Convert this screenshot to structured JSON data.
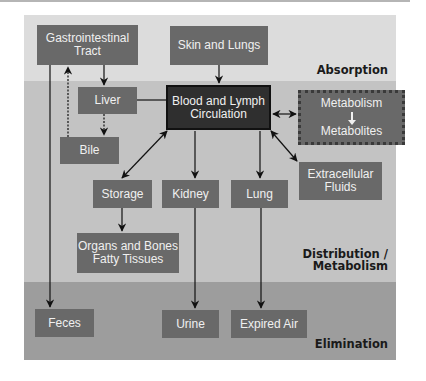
{
  "bands": {
    "absorption": "Absorption",
    "distribution_line1": "Distribution /",
    "distribution_line2": "Metabolism",
    "elimination": "Elimination"
  },
  "nodes": {
    "gi_tract": {
      "line1": "Gastrointestinal",
      "line2": "Tract"
    },
    "skin_lungs": "Skin and Lungs",
    "liver": "Liver",
    "blood_lymph": {
      "line1": "Blood and Lymph",
      "line2": "Circulation"
    },
    "metabolism": {
      "line1": "Metabolism",
      "line2": "Metabolites"
    },
    "bile": "Bile",
    "storage": "Storage",
    "kidney": "Kidney",
    "lung": "Lung",
    "extracellular": {
      "line1": "Extracellular",
      "line2": "Fluids"
    },
    "organs": {
      "line1": "Organs and Bones",
      "line2": "Fatty Tissues"
    },
    "feces": "Feces",
    "urine": "Urine",
    "expired_air": "Expired Air"
  },
  "colors": {
    "band_absorption": "#dcdcdc",
    "band_distribution": "#c3c3c3",
    "band_elimination": "#9d9d9d",
    "node": "#696969",
    "node_central": "#2f2f2f"
  }
}
